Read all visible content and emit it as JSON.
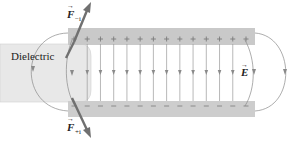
{
  "diagram": {
    "labels": {
      "dielectric": "Dielectric",
      "field_symbol": "E",
      "force_top": "F",
      "force_top_sub": "−i",
      "force_bottom": "F",
      "force_bottom_sub": "+i"
    },
    "top_plate": {
      "charge_sign": "+",
      "charge_count": 14
    },
    "bottom_plate": {
      "charge_sign": "−",
      "charge_count": 14
    },
    "field_lines_between_plates": 12,
    "colors": {
      "plate": "#c8c8c8",
      "dielectric": "#e6e6e6",
      "field_line": "#8a8a8a",
      "force_arrow": "#6e6e6e",
      "text": "#222222"
    }
  }
}
